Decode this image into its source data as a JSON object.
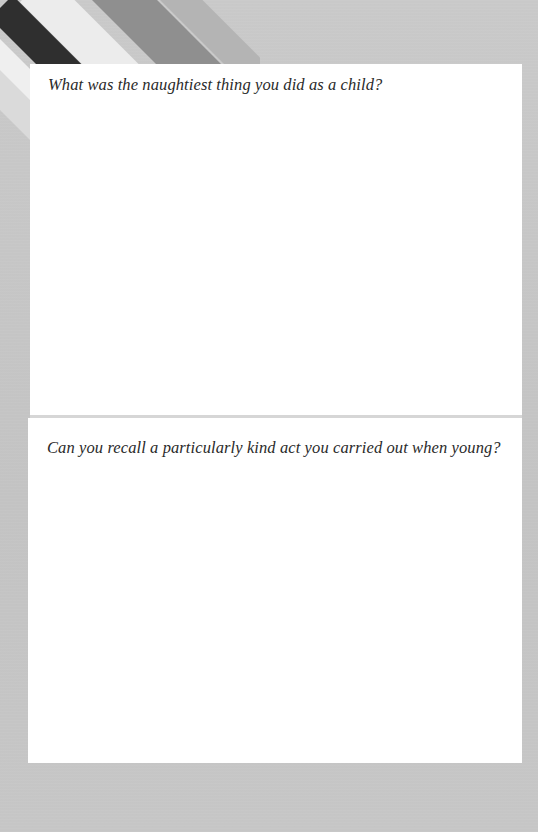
{
  "page": {
    "background_color": "#c4c4c4",
    "card_color": "#ffffff",
    "text_color": "#2a2a2a"
  },
  "decoration": {
    "stripes_icon": "diagonal-stripes-decoration"
  },
  "sections": [
    {
      "prompt": "What was the naughtiest thing you did as a child?",
      "answer": ""
    },
    {
      "prompt": "Can you recall a particularly kind act you carried out when young?",
      "answer": ""
    }
  ]
}
